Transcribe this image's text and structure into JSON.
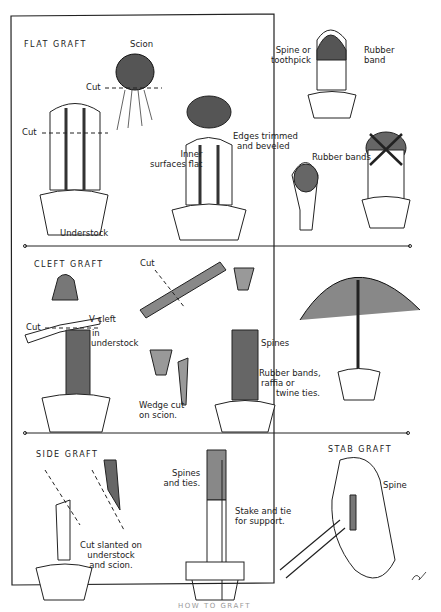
{
  "sections": [
    {
      "title": "FLAT GRAFT",
      "labels": {
        "scion": "Scion",
        "cut_scion": "Cut",
        "cut_understock": "Cut",
        "understock": "Understock",
        "inner_surfaces": [
          "Inner",
          "surfaces flat"
        ],
        "edges": [
          "Edges trimmed",
          "and beveled"
        ],
        "spine_toothpick": [
          "Spine or",
          "toothpick"
        ],
        "rubber_band": [
          "Rubber",
          "band"
        ],
        "rubber_bands": "Rubber bands"
      }
    },
    {
      "title": "CLEFT GRAFT",
      "labels": {
        "cut_left": "Cut",
        "cut_top": "Cut",
        "v_cleft": [
          "V cleft",
          "in",
          "understock"
        ],
        "wedge": [
          "Wedge cut",
          "on scion."
        ],
        "spines": "Spines",
        "ties": [
          "Rubber bands,",
          "raffia or",
          "twine ties."
        ]
      }
    },
    {
      "title": "SIDE GRAFT",
      "labels": {
        "cut_slanted": [
          "Cut slanted on",
          "understock",
          "and scion."
        ],
        "spines_ties": [
          "Spines",
          "and ties."
        ],
        "stake": [
          "Stake and tie",
          "for support."
        ]
      }
    },
    {
      "title": "STAB GRAFT",
      "labels": {
        "spine": "Spine"
      }
    }
  ],
  "caption": "HOW TO GRAFT"
}
